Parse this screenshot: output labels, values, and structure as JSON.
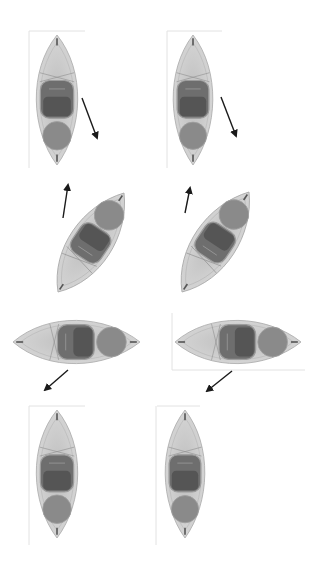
{
  "diagram": {
    "title": "",
    "colors": {
      "background": "#ffffff",
      "hull": "#cfcfcf",
      "hull_edge": "#a8a8a8",
      "cockpit": "#6e6e6e",
      "cockpit_inner": "#555555",
      "hatch": "#8a8a8a",
      "arrow": "#1a1a1a",
      "frame_line": "#e2e2e2"
    },
    "panels": [
      {
        "id": 1,
        "row": 1,
        "col": 1,
        "orientation": "vertical",
        "bow": [
          57,
          35
        ],
        "stern": [
          57,
          165
        ],
        "half_width": 23,
        "arrow": {
          "from": [
            82,
            98
          ],
          "to": [
            97,
            138
          ]
        }
      },
      {
        "id": 2,
        "row": 1,
        "col": 2,
        "orientation": "vertical",
        "bow": [
          193,
          35
        ],
        "stern": [
          193,
          165
        ],
        "half_width": 22,
        "arrow": {
          "from": [
            221,
            97
          ],
          "to": [
            236,
            136
          ]
        }
      },
      {
        "id": 3,
        "row": 2,
        "col": 1,
        "orientation": "diagonal",
        "bow": [
          58,
          292
        ],
        "stern": [
          124,
          193
        ],
        "half_width": 24,
        "arrow": {
          "from": [
            63,
            218
          ],
          "to": [
            68,
            185
          ]
        }
      },
      {
        "id": 4,
        "row": 2,
        "col": 2,
        "orientation": "diagonal",
        "bow": [
          182,
          292
        ],
        "stern": [
          249,
          192
        ],
        "half_width": 24,
        "arrow": {
          "from": [
            185,
            213
          ],
          "to": [
            190,
            188
          ]
        }
      },
      {
        "id": 5,
        "row": 3,
        "col": 1,
        "orientation": "horizontal",
        "bow": [
          13,
          342
        ],
        "stern": [
          140,
          342
        ],
        "half_width": 24,
        "arrow": {
          "from": [
            68,
            370
          ],
          "to": [
            45,
            390
          ]
        }
      },
      {
        "id": 6,
        "row": 3,
        "col": 2,
        "orientation": "horizontal",
        "bow": [
          175,
          342
        ],
        "stern": [
          301,
          342
        ],
        "half_width": 24,
        "arrow": {
          "from": [
            232,
            371
          ],
          "to": [
            207,
            391
          ]
        }
      },
      {
        "id": 7,
        "row": 4,
        "col": 1,
        "orientation": "vertical",
        "bow": [
          57,
          410
        ],
        "stern": [
          57,
          538
        ],
        "half_width": 23,
        "arrow": null
      },
      {
        "id": 8,
        "row": 4,
        "col": 2,
        "orientation": "vertical",
        "bow": [
          185,
          410
        ],
        "stern": [
          185,
          538
        ],
        "half_width": 22,
        "arrow": null
      }
    ],
    "frame_lines": [
      {
        "x1": 29,
        "y1": 31,
        "x2": 29,
        "y2": 168
      },
      {
        "x1": 29,
        "y1": 31,
        "x2": 85,
        "y2": 31
      },
      {
        "x1": 167,
        "y1": 31,
        "x2": 167,
        "y2": 168
      },
      {
        "x1": 167,
        "y1": 31,
        "x2": 222,
        "y2": 31
      },
      {
        "x1": 172,
        "y1": 313,
        "x2": 172,
        "y2": 370
      },
      {
        "x1": 172,
        "y1": 370,
        "x2": 305,
        "y2": 370
      },
      {
        "x1": 29,
        "y1": 406,
        "x2": 29,
        "y2": 545
      },
      {
        "x1": 29,
        "y1": 406,
        "x2": 85,
        "y2": 406
      },
      {
        "x1": 156,
        "y1": 406,
        "x2": 156,
        "y2": 545
      },
      {
        "x1": 157,
        "y1": 406,
        "x2": 200,
        "y2": 406
      }
    ]
  }
}
